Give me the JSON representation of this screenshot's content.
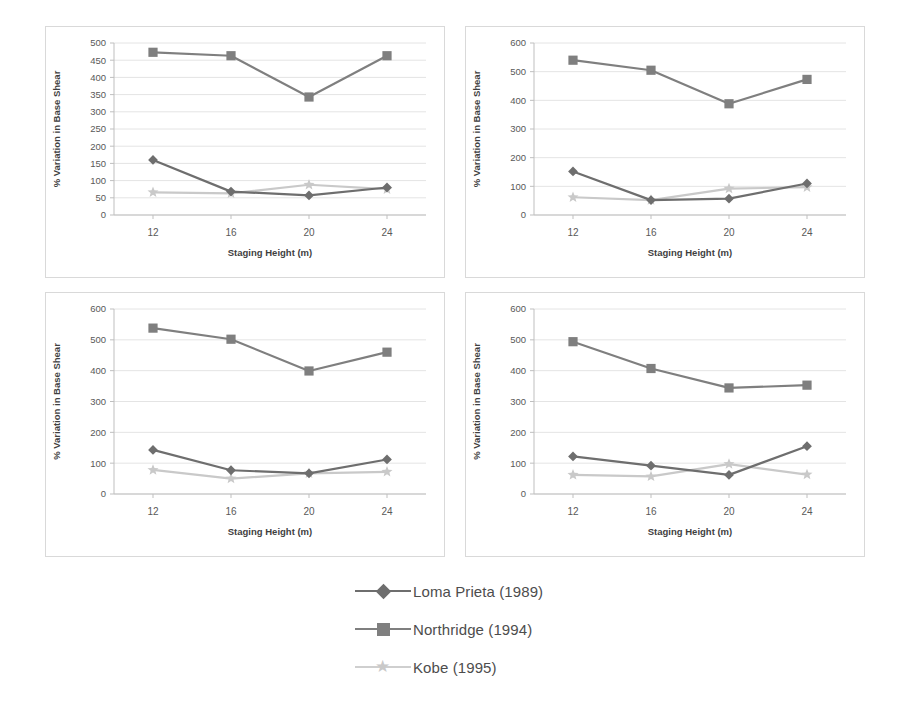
{
  "figure": {
    "panel_count": 4,
    "xlabel": "Staging Height (m)",
    "ylabel": "% Variation in Base Shear",
    "categories": [
      "12",
      "16",
      "20",
      "24"
    ]
  },
  "legend": {
    "position": "bottom-center",
    "items": [
      {
        "label": "Loma Prieta (1989)",
        "marker": "diamond",
        "color": "#6e6e6e"
      },
      {
        "label": "Northridge (1994)",
        "marker": "square",
        "color": "#7f7f7f"
      },
      {
        "label": "Kobe (1995)",
        "marker": "star",
        "color": "#c9c9c9"
      }
    ]
  },
  "colors": {
    "loma_prieta": "#6e6e6e",
    "northridge": "#7f7f7f",
    "kobe": "#c9c9c9",
    "gridline": "#e4e4e4",
    "axis": "#bfbfbf",
    "panel_border": "#d9d9d9",
    "text": "#595959"
  },
  "chart_data": [
    {
      "type": "line",
      "panel": "top-left",
      "title": "",
      "xlabel": "Staging Height (m)",
      "ylabel": "% Variation in Base Shear",
      "x": [
        12,
        16,
        20,
        24
      ],
      "xtick_labels": [
        "12",
        "16",
        "20",
        "24"
      ],
      "ylim": [
        0,
        500
      ],
      "ytick_step": 50,
      "ytick_labels": [
        "0",
        "50",
        "100",
        "150",
        "200",
        "250",
        "300",
        "350",
        "400",
        "450",
        "500"
      ],
      "grid": true,
      "series": [
        {
          "name": "Loma Prieta (1989)",
          "marker": "diamond",
          "color": "#6e6e6e",
          "values": [
            160,
            68,
            57,
            80
          ]
        },
        {
          "name": "Northridge (1994)",
          "marker": "square",
          "color": "#7f7f7f",
          "values": [
            473,
            463,
            343,
            463
          ]
        },
        {
          "name": "Kobe (1995)",
          "marker": "star",
          "color": "#c9c9c9",
          "values": [
            66,
            63,
            88,
            75
          ]
        }
      ]
    },
    {
      "type": "line",
      "panel": "top-right",
      "title": "",
      "xlabel": "Staging Height (m)",
      "ylabel": "% Variation in Base Shear",
      "x": [
        12,
        16,
        20,
        24
      ],
      "xtick_labels": [
        "12",
        "16",
        "20",
        "24"
      ],
      "ylim": [
        0,
        600
      ],
      "ytick_step": 100,
      "ytick_labels": [
        "0",
        "100",
        "200",
        "300",
        "400",
        "500",
        "600"
      ],
      "grid": true,
      "series": [
        {
          "name": "Loma Prieta (1989)",
          "marker": "diamond",
          "color": "#6e6e6e",
          "values": [
            152,
            52,
            57,
            110
          ]
        },
        {
          "name": "Northridge (1994)",
          "marker": "square",
          "color": "#7f7f7f",
          "values": [
            540,
            505,
            388,
            473
          ]
        },
        {
          "name": "Kobe (1995)",
          "marker": "star",
          "color": "#c9c9c9",
          "values": [
            62,
            52,
            92,
            97
          ]
        }
      ]
    },
    {
      "type": "line",
      "panel": "bottom-left",
      "title": "",
      "xlabel": "Staging Height (m)",
      "ylabel": "% Variation in Base Shear",
      "x": [
        12,
        16,
        20,
        24
      ],
      "xtick_labels": [
        "12",
        "16",
        "20",
        "24"
      ],
      "ylim": [
        0,
        600
      ],
      "ytick_step": 100,
      "ytick_labels": [
        "0",
        "100",
        "200",
        "300",
        "400",
        "500",
        "600"
      ],
      "grid": true,
      "series": [
        {
          "name": "Loma Prieta (1989)",
          "marker": "diamond",
          "color": "#6e6e6e",
          "values": [
            143,
            77,
            67,
            112
          ]
        },
        {
          "name": "Northridge (1994)",
          "marker": "square",
          "color": "#7f7f7f",
          "values": [
            538,
            502,
            399,
            460
          ]
        },
        {
          "name": "Kobe (1995)",
          "marker": "star",
          "color": "#c9c9c9",
          "values": [
            78,
            50,
            67,
            72
          ]
        }
      ]
    },
    {
      "type": "line",
      "panel": "bottom-right",
      "title": "",
      "xlabel": "Staging Height (m)",
      "ylabel": "% Variation in Base Shear",
      "x": [
        12,
        16,
        20,
        24
      ],
      "xtick_labels": [
        "12",
        "16",
        "20",
        "24"
      ],
      "ylim": [
        0,
        600
      ],
      "ytick_step": 100,
      "ytick_labels": [
        "0",
        "100",
        "200",
        "300",
        "400",
        "500",
        "600"
      ],
      "grid": true,
      "series": [
        {
          "name": "Loma Prieta (1989)",
          "marker": "diamond",
          "color": "#6e6e6e",
          "values": [
            122,
            92,
            62,
            155
          ]
        },
        {
          "name": "Northridge (1994)",
          "marker": "square",
          "color": "#7f7f7f",
          "values": [
            494,
            407,
            344,
            353
          ]
        },
        {
          "name": "Kobe (1995)",
          "marker": "star",
          "color": "#c9c9c9",
          "values": [
            62,
            57,
            97,
            63
          ]
        }
      ]
    }
  ]
}
